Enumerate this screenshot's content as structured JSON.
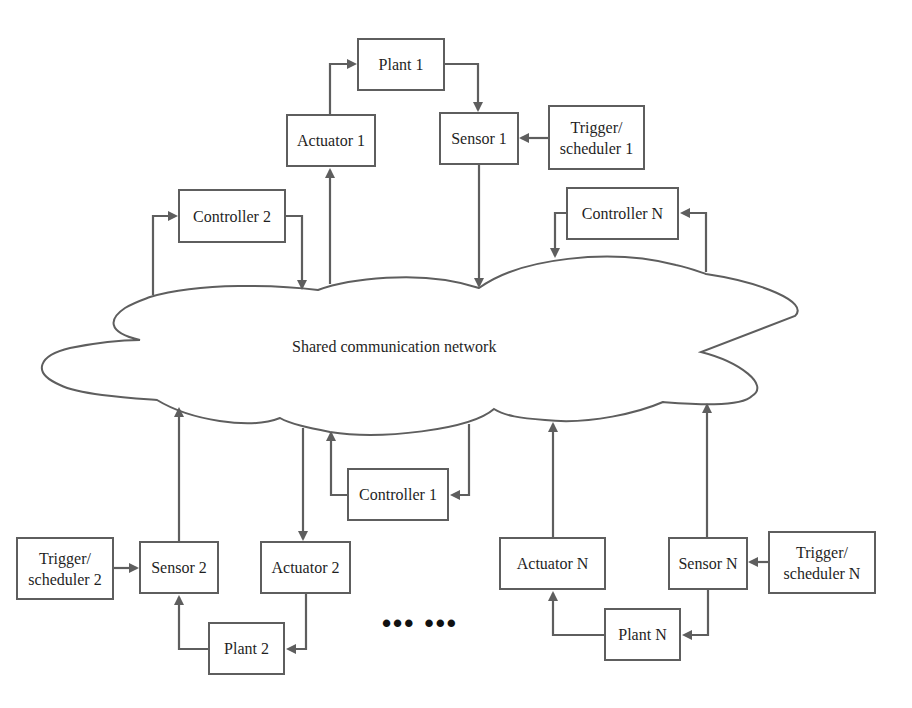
{
  "diagram": {
    "network": {
      "label": "Shared communication network"
    },
    "loop1": {
      "plant": "Plant 1",
      "actuator": "Actuator 1",
      "sensor": "Sensor 1",
      "trigger": "Trigger/\nscheduler 1",
      "controller": "Controller 1"
    },
    "loop2": {
      "plant": "Plant 2",
      "actuator": "Actuator 2",
      "sensor": "Sensor 2",
      "trigger": "Trigger/\nscheduler 2",
      "controller": "Controller 2"
    },
    "loopN": {
      "plant": "Plant N",
      "actuator": "Actuator N",
      "sensor": "Sensor N",
      "trigger": "Trigger/\nscheduler N",
      "controller": "Controller N"
    },
    "ellipsis": "••• •••",
    "colors": {
      "stroke": "#5e5e5e",
      "text": "#1f1f1f",
      "background": "#ffffff"
    }
  }
}
